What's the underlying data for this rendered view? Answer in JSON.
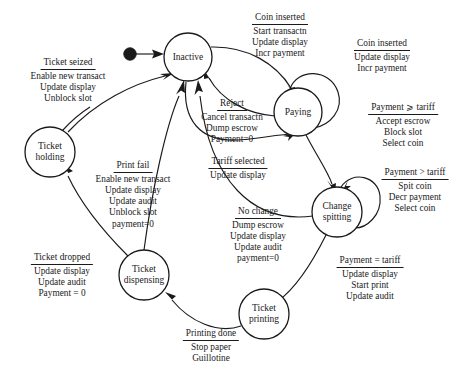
{
  "diagram": {
    "type": "state-machine",
    "stroke_color": "#1a1a1a",
    "background_color": "#ffffff",
    "initial_state": "Inactive",
    "states": [
      {
        "id": "inactive",
        "label": "Inactive",
        "line1": "Inactive",
        "line2": "",
        "cx": 188,
        "cy": 57,
        "r": 24
      },
      {
        "id": "paying",
        "label": "Paying",
        "line1": "Paying",
        "line2": "",
        "cx": 298,
        "cy": 112,
        "r": 24
      },
      {
        "id": "change",
        "label": "Change spitting",
        "line1": "Change",
        "line2": "spitting",
        "cx": 337,
        "cy": 212,
        "r": 25
      },
      {
        "id": "printing",
        "label": "Ticket printing",
        "line1": "Ticket",
        "line2": "printing",
        "cx": 264,
        "cy": 314,
        "r": 25
      },
      {
        "id": "dispensing",
        "label": "Ticket dispensing",
        "line1": "Ticket",
        "line2": "dispensing",
        "cx": 144,
        "cy": 275,
        "r": 25
      },
      {
        "id": "holding",
        "label": "Ticket holding",
        "line1": "Ticket",
        "line2": "holding",
        "cx": 50,
        "cy": 152,
        "r": 25
      }
    ],
    "transitions": [
      {
        "id": "t-coin-inserted-start",
        "from": "Inactive",
        "to": "Paying",
        "trigger": "Coin inserted",
        "actions": [
          "Start transactn",
          "Update display",
          "Incr payment"
        ],
        "label_x": 280,
        "label_y": 12
      },
      {
        "id": "t-coin-inserted-self",
        "from": "Paying",
        "to": "Paying",
        "trigger": "Coin inserted",
        "actions": [
          "Update display",
          "Incr payment"
        ],
        "label_x": 382,
        "label_y": 38
      },
      {
        "id": "t-payment-ge-tariff",
        "from": "Paying",
        "to": "Change spitting",
        "trigger": "Payment ⩾ tariff",
        "actions": [
          "Accept escrow",
          "Block slot",
          "Select coin"
        ],
        "label_x": 403,
        "label_y": 102
      },
      {
        "id": "t-payment-gt-tariff",
        "from": "Change spitting",
        "to": "Change spitting",
        "trigger": "Payment > tariff",
        "actions": [
          "Spit coin",
          "Decr payment",
          "Select coin"
        ],
        "label_x": 415,
        "label_y": 167
      },
      {
        "id": "t-reject",
        "from": "Paying",
        "to": "Inactive",
        "trigger": "Reject",
        "actions": [
          "Cancel transactn",
          "Dump escrow",
          "Payment=0"
        ],
        "label_x": 232,
        "label_y": 98
      },
      {
        "id": "t-tariff-selected",
        "from": "Inactive",
        "to": "Paying",
        "trigger": "Tariff selected",
        "actions": [
          "Update display"
        ],
        "label_x": 238,
        "label_y": 156
      },
      {
        "id": "t-no-change",
        "from": "Change spitting",
        "to": "Inactive",
        "trigger": "No change",
        "actions": [
          "Dump escrow",
          "Update display",
          "Update audit",
          "payment=0"
        ],
        "label_x": 258,
        "label_y": 206
      },
      {
        "id": "t-payment-eq-tariff",
        "from": "Change spitting",
        "to": "Ticket printing",
        "trigger": "Payment = tariff",
        "actions": [
          "Update display",
          "Start print",
          "Update audit"
        ],
        "label_x": 370,
        "label_y": 255
      },
      {
        "id": "t-printing-done",
        "from": "Ticket printing",
        "to": "Ticket dispensing",
        "trigger": "Printing done",
        "actions": [
          "Stop paper",
          "Guillotine"
        ],
        "label_x": 211,
        "label_y": 328
      },
      {
        "id": "t-ticket-dropped",
        "from": "Ticket dispensing",
        "to": "Inactive",
        "trigger": "Ticket dropped",
        "actions": [
          "Update display",
          "Update audit",
          "Payment = 0"
        ],
        "label_x": 62,
        "label_y": 252
      },
      {
        "id": "t-print-fail",
        "from": "Ticket dispensing",
        "to": "Ticket holding",
        "trigger": "Print fail",
        "actions": [
          "Enable new transact",
          "Update display",
          "Update audit",
          "Unblock slot",
          "payment=0"
        ],
        "label_x": 133,
        "label_y": 160
      },
      {
        "id": "t-ticket-seized",
        "from": "Ticket holding",
        "to": "Inactive",
        "trigger": "Ticket seized",
        "actions": [
          "Enable new transact",
          "Update display",
          "Unblock slot"
        ],
        "label_x": 68,
        "label_y": 57
      }
    ]
  }
}
